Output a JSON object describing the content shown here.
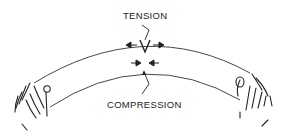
{
  "diagram": {
    "labels": {
      "tension": "TENSION",
      "compression": "COMPRESSION"
    },
    "colors": {
      "line": "#222222",
      "background": "#ffffff"
    }
  }
}
